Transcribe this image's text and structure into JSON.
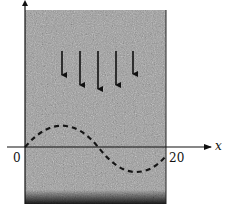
{
  "figure": {
    "axis": {
      "x_label": "x",
      "origin_label": "0",
      "end_label": "20"
    },
    "arrows": {
      "count": 5,
      "direction": "down",
      "items": [
        {
          "x": 62,
          "y1": 51,
          "y2": 75
        },
        {
          "x": 80,
          "y1": 51,
          "y2": 85
        },
        {
          "x": 98,
          "y1": 51,
          "y2": 89
        },
        {
          "x": 116,
          "y1": 51,
          "y2": 85
        },
        {
          "x": 133,
          "y1": 51,
          "y2": 74
        }
      ]
    },
    "curve": {
      "style": "dashed",
      "shape": "sine",
      "x_range": [
        0,
        20
      ]
    },
    "colors": {
      "medium": "#9a9a9a",
      "ink": "#111111",
      "background": "#ffffff"
    }
  }
}
